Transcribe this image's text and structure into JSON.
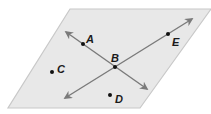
{
  "diagram": {
    "type": "plane-with-intersecting-lines",
    "colors": {
      "plane_fill": "#e8e8e8",
      "plane_edge": "#c8c8c8",
      "line": "#7a7a7a",
      "point": "#111111",
      "label": "#1a1a1a"
    },
    "plane": {
      "points": [
        [
          70,
          9
        ],
        [
          211,
          9
        ],
        [
          140,
          108
        ],
        [
          8,
          108
        ]
      ]
    },
    "lines": [
      {
        "name": "line-AB",
        "from": [
          66,
          32
        ],
        "to": [
          147,
          89
        ]
      },
      {
        "name": "line-EB",
        "from": [
          192,
          19
        ],
        "to": [
          65,
          98
        ]
      }
    ],
    "points": [
      {
        "id": "A",
        "label": "A",
        "x": 83,
        "y": 44,
        "lx": 86,
        "ly": 43
      },
      {
        "id": "B",
        "label": "B",
        "x": 115,
        "y": 67,
        "lx": 111,
        "ly": 62
      },
      {
        "id": "C",
        "label": "C",
        "x": 52,
        "y": 72,
        "lx": 57,
        "ly": 73
      },
      {
        "id": "D",
        "label": "D",
        "x": 110,
        "y": 95,
        "lx": 115,
        "ly": 103
      },
      {
        "id": "E",
        "label": "E",
        "x": 168,
        "y": 34,
        "lx": 172,
        "ly": 46
      }
    ]
  }
}
